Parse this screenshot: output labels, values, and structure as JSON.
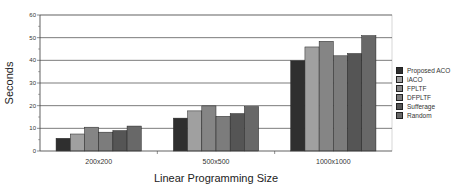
{
  "chart_data": {
    "type": "bar",
    "title": "",
    "xlabel": "Linear Programming Size",
    "ylabel": "Seconds",
    "ylim": [
      0,
      60
    ],
    "yticks": [
      0,
      10,
      20,
      30,
      40,
      50,
      60
    ],
    "grid": true,
    "legend_position": "right",
    "categories": [
      "200x200",
      "500x500",
      "1000x1000"
    ],
    "series": [
      {
        "name": "Proposed ACO",
        "color": "#2f2f2f",
        "values": [
          5.6,
          14.5,
          39.8
        ]
      },
      {
        "name": "iACO",
        "color": "#a0a0a0",
        "values": [
          7.5,
          17.7,
          45.9
        ]
      },
      {
        "name": "FPLTF",
        "color": "#858585",
        "values": [
          10.5,
          19.9,
          48.4
        ]
      },
      {
        "name": "DFPLTF",
        "color": "#7c7c7c",
        "values": [
          8.3,
          15.3,
          42.0
        ]
      },
      {
        "name": "Sufferage",
        "color": "#555555",
        "values": [
          9.0,
          16.5,
          43.0
        ]
      },
      {
        "name": "Random",
        "color": "#686868",
        "values": [
          11.0,
          19.6,
          50.9
        ]
      }
    ]
  }
}
